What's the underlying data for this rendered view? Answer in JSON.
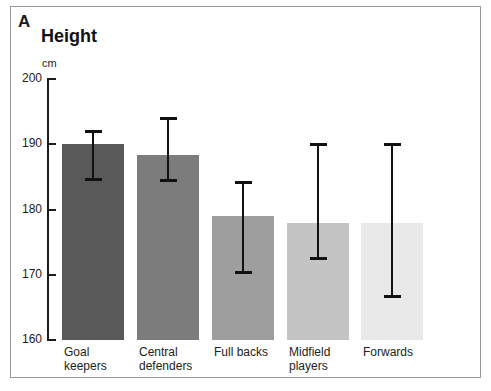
{
  "figure": {
    "panel_letter": "A",
    "title": "Height",
    "unit": "cm",
    "frame_color": "#9a9a9a",
    "background": "#ffffff"
  },
  "chart_data": {
    "type": "bar",
    "title": "Height",
    "xlabel": "",
    "ylabel": "cm",
    "ylim": [
      160,
      200
    ],
    "yticks": [
      160,
      170,
      180,
      190,
      200
    ],
    "grid": false,
    "legend": "none",
    "error_type": "range",
    "categories": [
      "Goal\nkeepers",
      "Central\ndefenders",
      "Full backs",
      "Midfield\nplayers",
      "Forwards"
    ],
    "categories_flat": [
      "Goal keepers",
      "Central defenders",
      "Full backs",
      "Midfield players",
      "Forwards"
    ],
    "values": [
      190.0,
      188.4,
      179.0,
      178.0,
      178.0
    ],
    "error_low": [
      184.7,
      184.5,
      170.4,
      172.5,
      166.8
    ],
    "error_high": [
      192.0,
      194.0,
      184.2,
      190.0,
      190.0
    ],
    "bar_colors": [
      "#595959",
      "#7c7c7c",
      "#9e9e9e",
      "#c4c4c4",
      "#e8e8e8"
    ],
    "error_color": "#111111"
  },
  "axis": {
    "tick_labels": [
      "200",
      "190",
      "180",
      "170",
      "160"
    ]
  }
}
